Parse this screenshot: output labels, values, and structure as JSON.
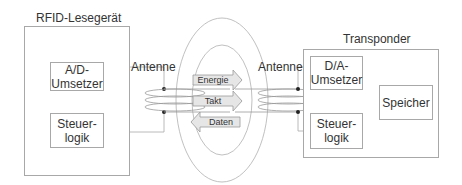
{
  "reader": {
    "title": "RFID-Lesegerät",
    "ad_converter": {
      "line1": "A/D-",
      "line2": "Umsetzer"
    },
    "control": {
      "line1": "Steuer-",
      "line2": "logik"
    },
    "antenna_label": "Antenne"
  },
  "transponder": {
    "title": "Transponder",
    "da_converter": {
      "line1": "D/A-",
      "line2": "Umsetzer"
    },
    "control": {
      "line1": "Steuer-",
      "line2": "logik"
    },
    "memory": "Speicher",
    "antenna_label": "Antenne"
  },
  "arrows": [
    {
      "label": "Energie",
      "direction": "right"
    },
    {
      "label": "Takt",
      "direction": "right"
    },
    {
      "label": "Daten",
      "direction": "left"
    }
  ],
  "colors": {
    "line": "#a8a8a8",
    "arrow_fill": "#e6e6e6",
    "text": "#333333"
  }
}
